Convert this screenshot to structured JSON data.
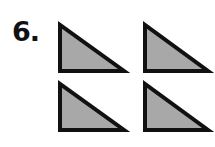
{
  "problem": {
    "number_label": "6."
  },
  "figure": {
    "shape": "right-triangle",
    "count": 4,
    "layout": "2x2 grid",
    "fill_color": "#a8a8a8",
    "stroke_color": "#111111",
    "stroke_width": 4,
    "triangles": [
      {
        "id": "top-left",
        "points": "60,25 60,71 124,71"
      },
      {
        "id": "top-right",
        "points": "145,25 145,71 208,71"
      },
      {
        "id": "bottom-left",
        "points": "60,84 60,130 124,130"
      },
      {
        "id": "bottom-right",
        "points": "145,84 145,130 208,130"
      }
    ]
  }
}
